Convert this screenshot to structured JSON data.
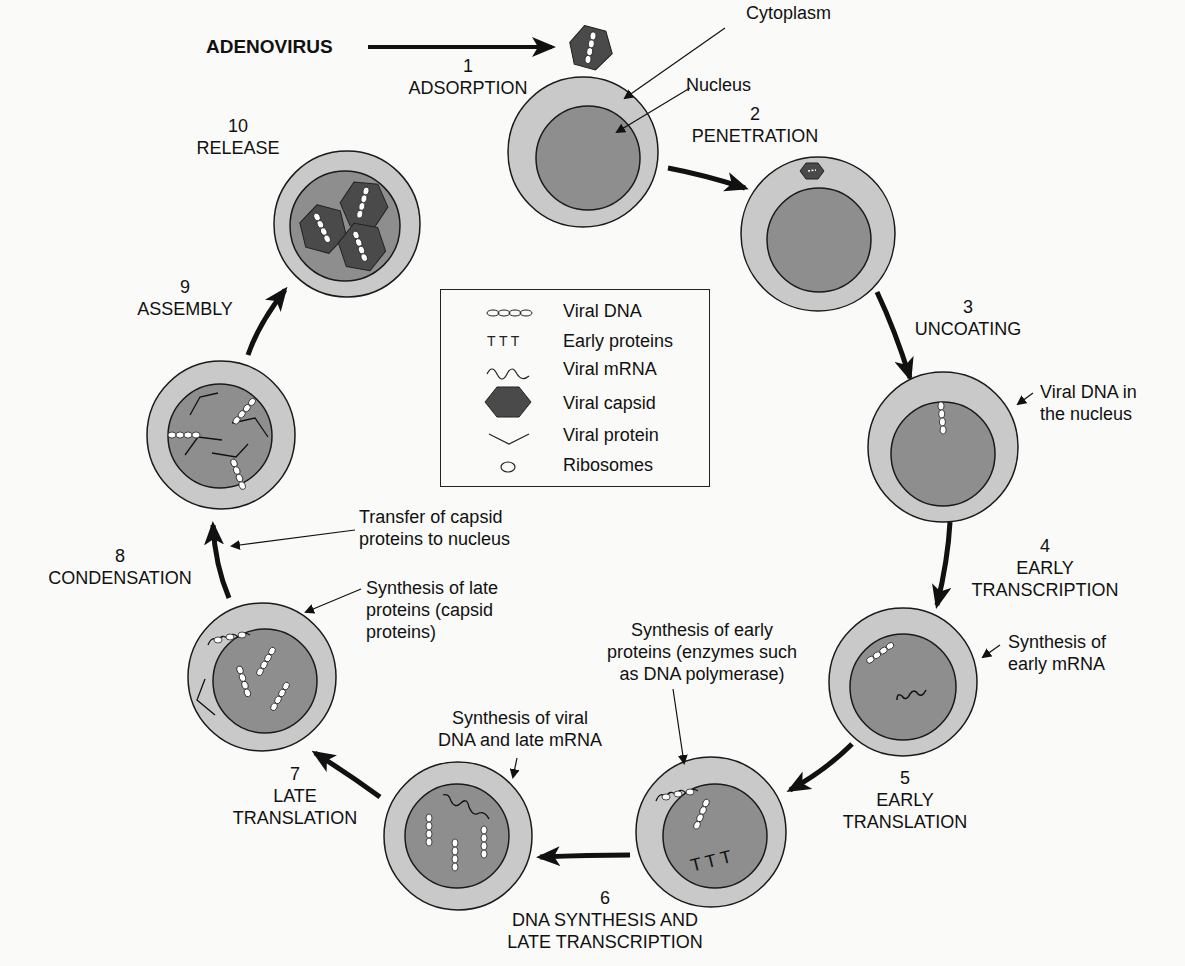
{
  "title": "ADENOVIRUS",
  "labels": {
    "cytoplasm": "Cytoplasm",
    "nucleus": "Nucleus",
    "viral_dna_nucleus": [
      "Viral DNA in",
      "the nucleus"
    ],
    "synth_early_mrna": [
      "Synthesis of",
      "early mRNA"
    ],
    "synth_early_proteins": [
      "Synthesis of early",
      "proteins (enzymes such",
      "as DNA polymerase)"
    ],
    "synth_viral_dna": [
      "Synthesis of viral",
      "DNA and late mRNA"
    ],
    "synth_late_proteins": [
      "Synthesis of late",
      "proteins (capsid",
      "proteins)"
    ],
    "transfer_capsid": [
      "Transfer of capsid",
      "proteins to nucleus"
    ]
  },
  "steps": [
    {
      "num": "1",
      "name": "ADSORPTION"
    },
    {
      "num": "2",
      "name": "PENETRATION"
    },
    {
      "num": "3",
      "name": "UNCOATING"
    },
    {
      "num": "4",
      "name": "EARLY",
      "name2": "TRANSCRIPTION"
    },
    {
      "num": "5",
      "name": "EARLY",
      "name2": "TRANSLATION"
    },
    {
      "num": "6",
      "name": "DNA SYNTHESIS AND",
      "name2": "LATE TRANSCRIPTION"
    },
    {
      "num": "7",
      "name": "LATE",
      "name2": "TRANSLATION"
    },
    {
      "num": "8",
      "name": "CONDENSATION"
    },
    {
      "num": "9",
      "name": "ASSEMBLY"
    },
    {
      "num": "10",
      "name": "RELEASE"
    }
  ],
  "legend": [
    {
      "icon": "viral-dna-icon",
      "label": "Viral DNA"
    },
    {
      "icon": "early-proteins-icon",
      "label": "Early proteins"
    },
    {
      "icon": "viral-mrna-icon",
      "label": "Viral mRNA"
    },
    {
      "icon": "viral-capsid-icon",
      "label": "Viral capsid"
    },
    {
      "icon": "viral-protein-icon",
      "label": "Viral protein"
    },
    {
      "icon": "ribosome-icon",
      "label": "Ribosomes"
    }
  ],
  "colors": {
    "cytoplasm": "#c9c9c9",
    "nucleus": "#8e8e8e",
    "capsid": "#4a4a4a",
    "outline": "#1a1a1a",
    "background": "#fafaf8"
  }
}
